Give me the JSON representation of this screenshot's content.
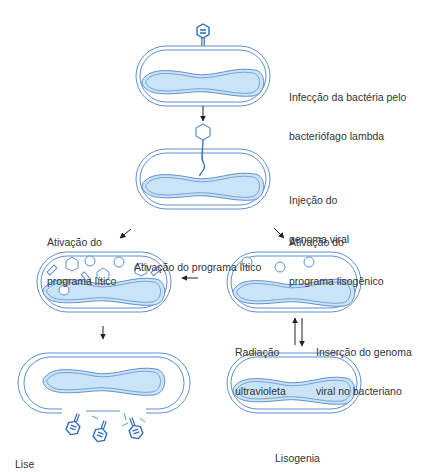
{
  "diagram": {
    "colors": {
      "membrane": "#5f8fcf",
      "nucleoid_fill": "#c9e4f6",
      "phage": "#2f6fb8",
      "arrow": "#222222",
      "text": "#333333"
    },
    "labels": {
      "infection": {
        "line1": "Infecção da bactéria pelo",
        "line2": "bacteriófago lambda"
      },
      "injection": {
        "line1": "Injeção do",
        "line2": "genoma viral"
      },
      "lytic_activation_left": {
        "line1": "Ativação do",
        "line2": "programa lítico"
      },
      "lysogenic_activation": {
        "line1": "Ativação do",
        "line2": "programa lisogênico"
      },
      "lytic_activation_center": {
        "line1": "Ativação do programa lítico"
      },
      "uv_radiation": {
        "line1": "Radiação",
        "line2": "ultravioleta"
      },
      "genome_insertion": {
        "line1": "Inserção do genoma",
        "line2": "viral no bacteriano"
      },
      "lysis": {
        "line1": "Lise"
      },
      "lysogeny": {
        "line1": "Lisogenia"
      }
    },
    "stages": [
      "bacterium-with-attached-phage",
      "viral-genome-injection",
      "lytic-cell-with-assembling-phages",
      "lysogenic-cell-with-circles",
      "lysed-cell-releasing-phages",
      "lysogen-cell"
    ]
  }
}
